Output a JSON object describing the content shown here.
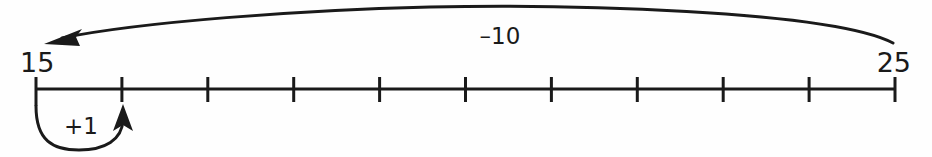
{
  "diagram": {
    "type": "number-line",
    "background_color": "#fefefe",
    "ink_color": "#1a1a1a",
    "number_line": {
      "start_value": "15",
      "end_value": "25",
      "start_label": "15",
      "end_label": "25",
      "tick_count": 11,
      "tick_values": [
        "15",
        "16",
        "17",
        "18",
        "19",
        "20",
        "21",
        "22",
        "23",
        "24",
        "25"
      ],
      "axis_y": 89,
      "first_tick_x": 36,
      "tick_spacing": 85.9,
      "tick_top_y": 77,
      "tick_bottom_y": 102
    },
    "jumps": [
      {
        "name": "minus-ten-jump",
        "label": "–10",
        "value": -10,
        "from_value": "25",
        "to_value": "15",
        "direction": "left",
        "arc_side": "above",
        "label_x": 500,
        "label_y": 44,
        "start_x": 893,
        "start_y": 43,
        "end_x": 48,
        "end_y": 41,
        "apex_y": 7
      },
      {
        "name": "plus-one-jump",
        "label": "+1",
        "value": 1,
        "from_value": "15",
        "to_value": "16",
        "direction": "right",
        "arc_side": "below",
        "label_x": 81,
        "label_y": 134,
        "start_x": 36,
        "start_y": 106,
        "end_x": 123,
        "end_y": 106,
        "bottom_y": 150
      }
    ]
  }
}
